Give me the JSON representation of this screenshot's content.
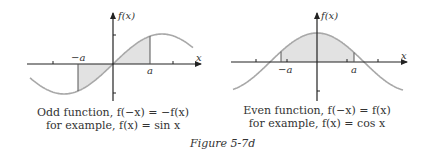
{
  "figure": {
    "title": "Figure 5-7d",
    "panels": [
      {
        "name": "odd",
        "caption_line1": "Odd function, f(−x) = −f(x)",
        "caption_line2": "for example, f(x) = sin x",
        "y_axis_label": "f(x)",
        "x_axis_label": "x",
        "neg_a_label": "−a",
        "pos_a_label": "a"
      },
      {
        "name": "even",
        "caption_line1": "Even function, f(−x) = f(x)",
        "caption_line2": "for example, f(x) = cos x",
        "y_axis_label": "f(x)",
        "x_axis_label": "x",
        "neg_a_label": "−a",
        "pos_a_label": "a"
      }
    ]
  },
  "colors": {
    "curve": "#a8a8a8",
    "fill": "#e2e2e2",
    "axis": "#222222"
  }
}
